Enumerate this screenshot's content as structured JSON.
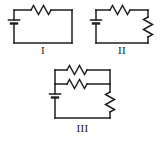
{
  "figure": {
    "background_color": "#ffffff",
    "line_color": "#1f1f1f",
    "width": 161,
    "height": 150
  },
  "circuits": [
    {
      "id": "circuit-one",
      "label": "I",
      "description": "Single loop: battery in series with one resistor",
      "components": [
        {
          "type": "battery",
          "name": "battery",
          "position": "left",
          "orientation": "vertical"
        },
        {
          "type": "resistor",
          "name": "resistor-top",
          "position": "top",
          "orientation": "horizontal"
        }
      ],
      "box": {
        "x": 14,
        "y": 10,
        "width": 58,
        "height": 33
      }
    },
    {
      "id": "circuit-two",
      "label": "II",
      "description": "Single loop: battery in series with two resistors",
      "components": [
        {
          "type": "battery",
          "name": "battery",
          "position": "left",
          "orientation": "vertical"
        },
        {
          "type": "resistor",
          "name": "resistor-top",
          "position": "top",
          "orientation": "horizontal"
        },
        {
          "type": "resistor",
          "name": "resistor-right",
          "position": "right",
          "orientation": "vertical"
        }
      ],
      "box": {
        "x": 96,
        "y": 10,
        "width": 52,
        "height": 33
      }
    },
    {
      "id": "circuit-three",
      "label": "III",
      "description": "Battery with two parallel resistors in series with a third resistor",
      "components": [
        {
          "type": "battery",
          "name": "battery",
          "position": "left",
          "orientation": "vertical"
        },
        {
          "type": "resistor",
          "name": "resistor-top-branch",
          "position": "top",
          "orientation": "horizontal"
        },
        {
          "type": "resistor",
          "name": "resistor-middle-branch",
          "position": "middle",
          "orientation": "horizontal"
        },
        {
          "type": "resistor",
          "name": "resistor-right",
          "position": "right",
          "orientation": "vertical"
        }
      ],
      "box": {
        "x": 55,
        "y": 70,
        "width": 55,
        "height": 48
      }
    }
  ]
}
